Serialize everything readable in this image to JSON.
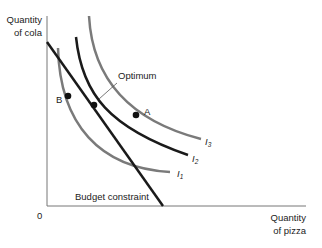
{
  "axes": {
    "y_label_line1": "Quantity",
    "y_label_line2": "of cola",
    "x_label_line1": "Quantity",
    "x_label_line2": "of pizza",
    "origin": "0"
  },
  "labels": {
    "optimum": "Optimum",
    "budget": "Budget constraint",
    "point_a": "A",
    "point_b": "B",
    "i_letter": "I",
    "i1_sub": "1",
    "i2_sub": "2",
    "i3_sub": "3"
  },
  "colors": {
    "indifference_grey": "#7a7a7a",
    "black": "#1a1a1a"
  }
}
